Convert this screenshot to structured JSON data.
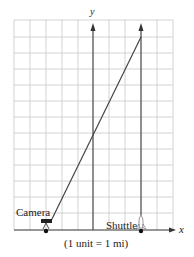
{
  "diagram": {
    "y_axis_label": "y",
    "x_axis_label": "x",
    "camera_label": "Camera",
    "shuttle_label": "Shuttle",
    "scale_note": "(1 unit = 1 mi)",
    "camera_x": -3,
    "shuttle_x": 3,
    "line_top": {
      "x": 3,
      "y": 12
    },
    "grid": {
      "x_min": -5,
      "x_max": 5,
      "y_min": 0,
      "y_max": 13
    },
    "colors": {
      "grid": "#c8c8c8",
      "axis": "#333333",
      "line": "#444444"
    }
  }
}
